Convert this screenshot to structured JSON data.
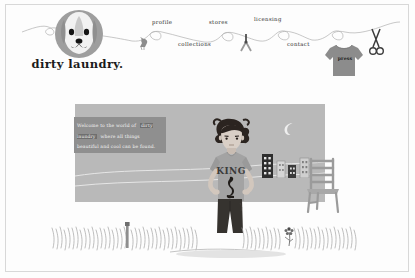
{
  "site": {
    "brand": "dirty laundry.",
    "logo_icon": "dog-face-icon"
  },
  "nav": {
    "items": [
      {
        "label": "profile",
        "icon": "clothesline-loop-icon"
      },
      {
        "label": "collections",
        "icon": "clothesline-loop-icon"
      },
      {
        "label": "stores",
        "icon": "clothesline-loop-icon"
      },
      {
        "label": "licensing",
        "icon": "clothesline-loop-icon"
      },
      {
        "label": "contact",
        "icon": "clothesline-loop-icon"
      }
    ],
    "press": {
      "label": "press",
      "icon": "tshirt-icon"
    },
    "decorations": {
      "bird": "bird-icon",
      "clothespin": "clothespin-icon",
      "scissors": "scissors-icon",
      "clothesline": "clothesline-icon"
    }
  },
  "hero": {
    "caption": {
      "line1": "Welcome to the world of",
      "brand": "dirty laundry",
      "line2": "where all things",
      "line3": "beautiful and cool can be found."
    },
    "scene": {
      "moon": "crescent-moon-icon",
      "buildings": "city-blocks-icon",
      "chair": "ladder-back-chair-icon",
      "character": "boy-standing-icon",
      "character_shirt_text": "KING",
      "grass": "grass-icon",
      "flower": "flower-icon",
      "post": "garden-post-icon"
    }
  },
  "colors": {
    "page_background": "#fdfdfd",
    "border": "#d8d8d8",
    "hero_panel": "#b9b9b9",
    "caption_background": "#8f8f8f",
    "brand_highlight": "#6f6f6f",
    "logo_gray": "#9a9a9a",
    "shirt_gray": "#9d9d9d",
    "pants_dark": "#3a3a3a",
    "text_dark": "#1b1b1b"
  }
}
